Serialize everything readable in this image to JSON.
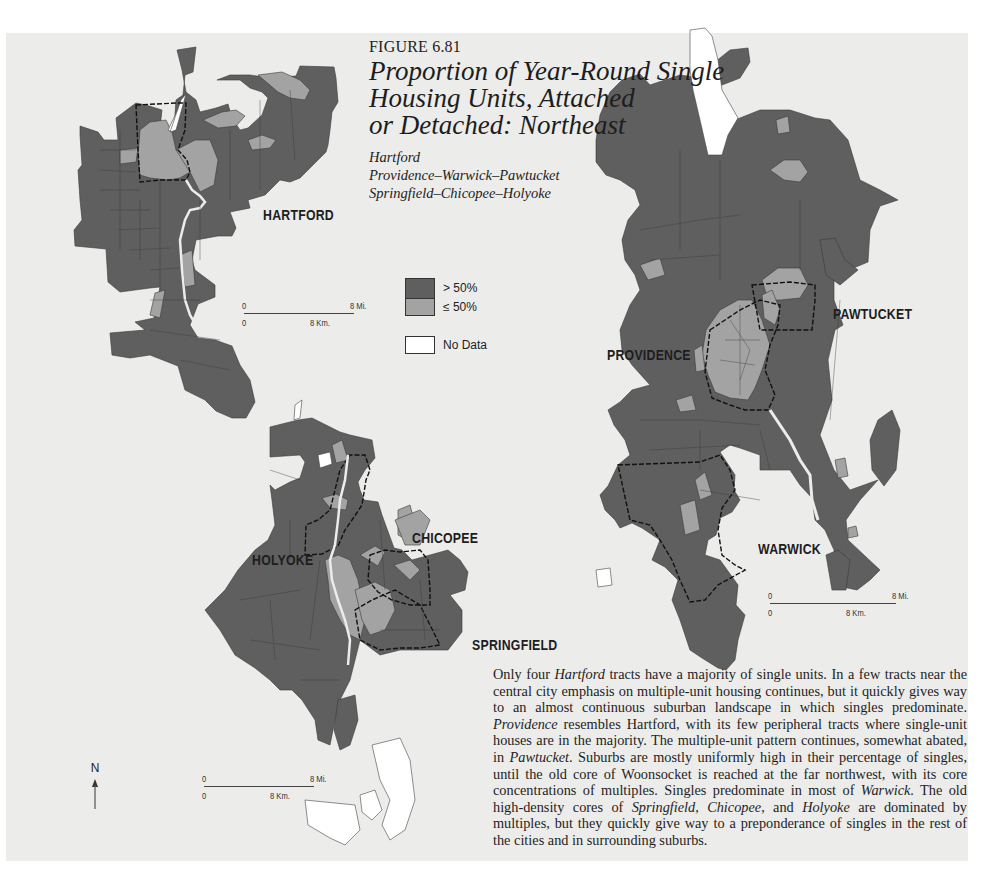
{
  "figure": {
    "number": "FIGURE 6.81",
    "title": "Proportion of Year-Round Single Housing Units, Attached or Detached: Northeast",
    "title_lines": [
      "Proportion of Year-Round Single",
      "Housing Units, Attached",
      "or Detached: Northeast"
    ],
    "subtitles": [
      "Hartford",
      "Providence–Warwick–Pawtucket",
      "Springfield–Chicopee–Holyoke"
    ]
  },
  "colors": {
    "above_50": "#5f5f60",
    "at_or_below_50": "#a3a3a3",
    "no_data": "#ffffff",
    "panel_background": "#ececea",
    "boundary": "#111111"
  },
  "legend": {
    "items": [
      {
        "label": "> 50%",
        "color": "#5f5f60"
      },
      {
        "label": "≤ 50%",
        "color": "#a3a3a3"
      },
      {
        "label": "No Data",
        "color": "#ffffff"
      }
    ]
  },
  "maps": [
    {
      "name": "Hartford",
      "labels": [
        "HARTFORD"
      ],
      "scale": {
        "top_left": "0",
        "top_right": "8 Mi.",
        "bottom_left": "0",
        "bottom_mid": "8 Km."
      }
    },
    {
      "name": "Providence–Warwick–Pawtucket",
      "labels": [
        "PROVIDENCE",
        "PAWTUCKET",
        "WARWICK"
      ],
      "scale": {
        "top_left": "0",
        "top_right": "8 Mi.",
        "bottom_left": "0",
        "bottom_mid": "8 Km."
      }
    },
    {
      "name": "Springfield–Chicopee–Holyoke",
      "labels": [
        "HOLYOKE",
        "CHICOPEE",
        "SPRINGFIELD"
      ],
      "scale": {
        "top_left": "0",
        "top_right": "8 Mi.",
        "bottom_left": "0",
        "bottom_mid": "8 Km."
      }
    }
  ],
  "north_arrow": {
    "label": "N"
  },
  "caption": {
    "segments": [
      {
        "t": "Only four ",
        "i": false
      },
      {
        "t": "Hartford",
        "i": true
      },
      {
        "t": " tracts have a majority of single units. In a few tracts near the central city emphasis on multiple-unit housing continues, but it quickly gives way to an almost continuous suburban landscape in which singles pre­dominate. ",
        "i": false
      },
      {
        "t": "Providence",
        "i": true
      },
      {
        "t": " resembles Hartford, with its few peripheral tracts where single-unit houses are in the majority. The multiple-unit pattern con­tinues, somewhat abated, in ",
        "i": false
      },
      {
        "t": "Pawtucket",
        "i": true
      },
      {
        "t": ". Suburbs are mostly uniformly high in their percentage of singles, until the old core of Woonsocket is reached at the far northwest, with its core concentrations of multiples. Singles predom­inate in most of ",
        "i": false
      },
      {
        "t": "Warwick",
        "i": true
      },
      {
        "t": ". The old high-density cores of ",
        "i": false
      },
      {
        "t": "Springfield",
        "i": true
      },
      {
        "t": ", ",
        "i": false
      },
      {
        "t": "Chico­pee",
        "i": true
      },
      {
        "t": ", and ",
        "i": false
      },
      {
        "t": "Holyoke",
        "i": true
      },
      {
        "t": " are dominated by multiples, but they quickly give way to a preponderance of singles in the rest of the cities and in surrounding sub­urbs.",
        "i": false
      }
    ]
  }
}
